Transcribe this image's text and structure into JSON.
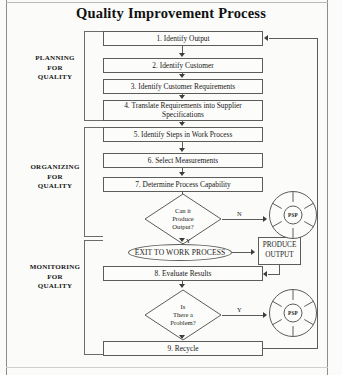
{
  "title": "Quality Improvement Process",
  "groups": [
    {
      "id": "planning",
      "label": "PLANNING\nFOR\nQUALITY",
      "line1": "PLANNING",
      "line2": "FOR",
      "line3": "QUALITY"
    },
    {
      "id": "organizing",
      "label": "ORGANIZING\nFOR\nQUALITY",
      "line1": "ORGANIZING",
      "line2": "FOR",
      "line3": "QUALITY"
    },
    {
      "id": "monitoring",
      "label": "MONITORING\nFOR\nQUALITY",
      "line1": "MONITORING",
      "line2": "FOR",
      "line3": "QUALITY"
    }
  ],
  "steps": [
    {
      "number": "1.",
      "text": "1.  Identify Output"
    },
    {
      "number": "2.",
      "text": "2.  Identify Customer"
    },
    {
      "number": "3.",
      "text": "3.  Identify Customer Requirements"
    },
    {
      "number": "4.",
      "text": "4.  Translate Requirements into Supplier Specifications",
      "line1": "4.  Translate Requirements into Supplier",
      "line2": "Specifications"
    },
    {
      "number": "5.",
      "text": "5.  Identify Steps in Work Process"
    },
    {
      "number": "6.",
      "text": "6.  Select Measurements"
    },
    {
      "number": "7.",
      "text": "7.  Determine Process Capability"
    },
    {
      "number": "8.",
      "text": "8.  Evaluate Results"
    },
    {
      "number": "9.",
      "text": "9.  Recycle"
    }
  ],
  "decisions": [
    {
      "id": "can-it-produce-output",
      "line1": "Can it",
      "line2": "Produce",
      "line3": "Output?",
      "yes_label": "Y",
      "no_label": "N"
    },
    {
      "id": "is-there-a-problem",
      "line1": "Is",
      "line2": "There a",
      "line3": "Problem?",
      "yes_label": "Y",
      "no_label": "N"
    }
  ],
  "terminals": {
    "exit_to_work_process": "EXIT TO WORK PROCESS",
    "produce_output_line1": "PRODUCE",
    "produce_output_line2": "OUTPUT"
  },
  "wheels": [
    {
      "id": "psp-wheel-top",
      "label": "PSP"
    },
    {
      "id": "psp-wheel-bottom",
      "label": "PSP"
    }
  ],
  "colors": {
    "stroke": "#5c5c5a",
    "arrow": "#3d3d3c",
    "background": "#fbfbf9",
    "box_fill": "#fcfcfa",
    "text": "#1b1b1b"
  }
}
